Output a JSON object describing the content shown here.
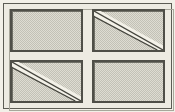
{
  "diagram": {
    "width": 175,
    "height": 112,
    "frame": {
      "name": "outer-frame",
      "border_color": "#5c5c54",
      "inner_edge_color": "#a8a79b",
      "background_color": "#edebe2"
    },
    "panel_style": {
      "outline_color": "#4f4f48",
      "fill_color": "#cfcec4",
      "fill_pattern": "checkerboard-dither",
      "fill_light": "#dedcd2",
      "fill_dark": "#c2c1b6"
    },
    "diagonal_style": {
      "band_color": "#f3f1e8",
      "edge_color": "#44443d",
      "direction": "top-left-to-bottom-right"
    },
    "panels": [
      {
        "id": "top-left",
        "label": "Panel 1",
        "row": 1,
        "column": 1,
        "has_diagonal": false,
        "diagonal_direction": ""
      },
      {
        "id": "top-right",
        "label": "Panel 2",
        "row": 1,
        "column": 2,
        "has_diagonal": true,
        "diagonal_direction": "top-left-to-bottom-right"
      },
      {
        "id": "bottom-left",
        "label": "Panel 3",
        "row": 2,
        "column": 1,
        "has_diagonal": true,
        "diagonal_direction": "top-left-to-bottom-right"
      },
      {
        "id": "bottom-right",
        "label": "Panel 4",
        "row": 2,
        "column": 2,
        "has_diagonal": false,
        "diagonal_direction": ""
      }
    ]
  }
}
